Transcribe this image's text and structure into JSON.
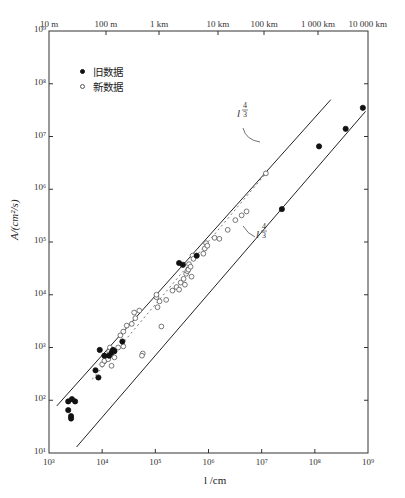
{
  "chart_data": {
    "type": "scatter",
    "title": "",
    "xlabel": "l /cm",
    "ylabel": "A/(cm²/s)",
    "xscale": "log",
    "yscale": "log",
    "xlim": [
      1000,
      1000000000
    ],
    "ylim": [
      10,
      1000000000
    ],
    "x_ticks": [
      "10³",
      "10⁴",
      "10⁵",
      "10⁶",
      "10⁷",
      "10⁸",
      "10⁹"
    ],
    "y_ticks": [
      "10¹",
      "10²",
      "10³",
      "10⁴",
      "10⁵",
      "10⁶",
      "10⁷",
      "10⁸",
      "10⁹"
    ],
    "top_axis_ticks": [
      "10 m",
      "100 m",
      "1 km",
      "10 km",
      "100 km",
      "1 000 km",
      "10 000 km"
    ],
    "grid": false,
    "legend_position": "upper-left",
    "series": [
      {
        "name": "旧数据",
        "marker": "filled-circle",
        "points": [
          [
            2300,
            95
          ],
          [
            2700,
            105
          ],
          [
            3100,
            95
          ],
          [
            2300,
            65
          ],
          [
            2600,
            50
          ],
          [
            2600,
            45
          ],
          [
            7500,
            370
          ],
          [
            8500,
            270
          ],
          [
            9000,
            900
          ],
          [
            11000,
            700
          ],
          [
            13500,
            700
          ],
          [
            15000,
            800
          ],
          [
            16000,
            900
          ],
          [
            17000,
            850
          ],
          [
            24000,
            1300
          ],
          [
            280000,
            40000
          ],
          [
            330000,
            37000
          ],
          [
            600000,
            55000
          ],
          [
            24000000,
            420000
          ],
          [
            120000000,
            6500000
          ],
          [
            380000000,
            14000000
          ],
          [
            800000000,
            35000000
          ]
        ]
      },
      {
        "name": "新数据",
        "marker": "open-circle",
        "points": [
          [
            10000,
            480
          ],
          [
            11000,
            560
          ],
          [
            13000,
            600
          ],
          [
            15000,
            450
          ],
          [
            17000,
            650
          ],
          [
            13500,
            850
          ],
          [
            14000,
            1000
          ],
          [
            20000,
            1000
          ],
          [
            25000,
            1050
          ],
          [
            22000,
            1700
          ],
          [
            25000,
            2000
          ],
          [
            29000,
            2600
          ],
          [
            36000,
            2800
          ],
          [
            42000,
            3600
          ],
          [
            40000,
            4600
          ],
          [
            50000,
            5000
          ],
          [
            58000,
            770
          ],
          [
            56000,
            700
          ],
          [
            105000,
            9000
          ],
          [
            105000,
            10000
          ],
          [
            120000,
            7500
          ],
          [
            110000,
            5800
          ],
          [
            130000,
            2500
          ],
          [
            160000,
            8000
          ],
          [
            210000,
            12000
          ],
          [
            250000,
            14000
          ],
          [
            280000,
            12500
          ],
          [
            300000,
            17000
          ],
          [
            340000,
            20000
          ],
          [
            360000,
            15500
          ],
          [
            380000,
            25000
          ],
          [
            400000,
            28000
          ],
          [
            420000,
            30000
          ],
          [
            430000,
            38000
          ],
          [
            460000,
            34000
          ],
          [
            480000,
            22000
          ],
          [
            500000,
            55000
          ],
          [
            520000,
            48000
          ],
          [
            800000,
            60000
          ],
          [
            850000,
            75000
          ],
          [
            900000,
            95000
          ],
          [
            950000,
            85000
          ],
          [
            1300000,
            120000
          ],
          [
            1600000,
            115000
          ],
          [
            2300000,
            170000
          ],
          [
            3200000,
            260000
          ],
          [
            4200000,
            320000
          ],
          [
            5200000,
            380000
          ],
          [
            12000000,
            2000000
          ]
        ]
      }
    ],
    "reference_lines": [
      {
        "label": "l^(4/3)",
        "from": [
          1400,
          78
        ],
        "to": [
          200000000,
          50000000
        ],
        "label_pos": [
          1200000,
          4000000
        ]
      },
      {
        "label": "l^(4/3)",
        "from": [
          3300,
          13
        ],
        "to": [
          900000000,
          30000000
        ],
        "label_pos": [
          1700000,
          200000
        ]
      }
    ],
    "trend_line": {
      "style": "dashed",
      "from": [
        6500,
        250
      ],
      "to": [
        12000000,
        2000000
      ]
    }
  },
  "legend": {
    "old_label": "旧数据",
    "new_label": "新数据"
  },
  "axes": {
    "xlabel": "l /cm",
    "ylabel": "A/(cm²/s)"
  },
  "annotations": {
    "upper_line_exp_num": "4",
    "upper_line_exp_den": "3",
    "lower_line_exp_num": "4",
    "lower_line_exp_den": "3",
    "line_base": "l"
  }
}
